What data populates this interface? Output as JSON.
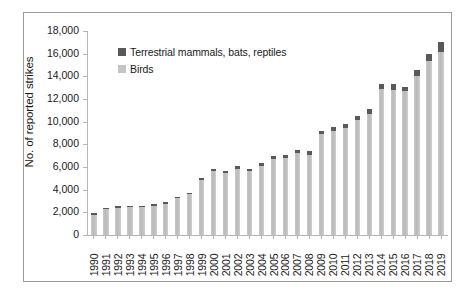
{
  "chart_data": {
    "type": "bar",
    "subtype": "stacked-bar",
    "title": "",
    "xlabel": "",
    "ylabel": "No. of reported strikes",
    "ylim": [
      0,
      18000
    ],
    "ytick_step": 2000,
    "ytick_labels": [
      "0",
      "2,000",
      "4,000",
      "6,000",
      "8,000",
      "10,000",
      "12,000",
      "14,000",
      "16,000",
      "18,000"
    ],
    "ytick_values": [
      0,
      2000,
      4000,
      6000,
      8000,
      10000,
      12000,
      14000,
      16000,
      18000
    ],
    "grid": false,
    "legend_position": "top-left-inside",
    "categories": [
      "1990",
      "1991",
      "1992",
      "1993",
      "1994",
      "1995",
      "1996",
      "1997",
      "1998",
      "1999",
      "2000",
      "2001",
      "2002",
      "2003",
      "2004",
      "2005",
      "2006",
      "2007",
      "2008",
      "2009",
      "2010",
      "2011",
      "2012",
      "2013",
      "2014",
      "2015",
      "2016",
      "2017",
      "2018",
      "2019"
    ],
    "series": [
      {
        "name": "Birds",
        "color": "#c4c4c4",
        "values": [
          1790,
          2290,
          2400,
          2450,
          2470,
          2600,
          2770,
          3230,
          3590,
          4850,
          5620,
          5440,
          5840,
          5620,
          6130,
          6750,
          6770,
          7260,
          7080,
          8870,
          9200,
          9420,
          10130,
          10680,
          12840,
          12830,
          12690,
          14040,
          15360,
          16150
        ]
      },
      {
        "name": "Terrestrial mammals, bats, reptiles",
        "color": "#595959",
        "values": [
          80,
          90,
          100,
          100,
          100,
          110,
          120,
          130,
          140,
          160,
          190,
          180,
          210,
          200,
          240,
          250,
          250,
          270,
          290,
          310,
          340,
          340,
          400,
          420,
          480,
          520,
          380,
          510,
          640,
          870
        ]
      }
    ],
    "totals": [
      1870,
      2380,
      2500,
      2550,
      2570,
      2710,
      2890,
      3360,
      3730,
      5010,
      5810,
      5620,
      6050,
      5820,
      6370,
      7000,
      7020,
      7530,
      7370,
      9180,
      9540,
      9760,
      10530,
      11100,
      13320,
      13350,
      13070,
      14550,
      16000,
      17020
    ]
  },
  "legend": {
    "items": [
      {
        "label": "Terrestrial mammals, bats, reptiles",
        "swatch": "dark-gray-swatch"
      },
      {
        "label": "Birds",
        "swatch": "light-gray-swatch"
      }
    ]
  },
  "colors": {
    "bird": "#c4c4c4",
    "mammal": "#595959",
    "axis": "#b6b6b6",
    "frame": "#9a9a9a",
    "text": "#1a1a1a",
    "background": "#ffffff"
  }
}
